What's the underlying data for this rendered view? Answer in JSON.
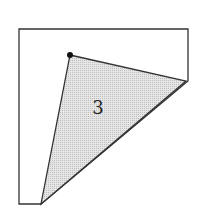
{
  "diagram": {
    "type": "geometry-figure",
    "outer_shape": {
      "points": [
        [
          19,
          29
        ],
        [
          188,
          29
        ],
        [
          188,
          81
        ],
        [
          41,
          204
        ],
        [
          19,
          204
        ]
      ],
      "stroke": "#333333",
      "fill": "#ffffff"
    },
    "triangle": {
      "points": [
        [
          70,
          55
        ],
        [
          186,
          81
        ],
        [
          41,
          204
        ]
      ],
      "stroke": "#333333",
      "fill": "#d9d9d9",
      "label": "3",
      "label_pos": [
        98,
        114
      ]
    },
    "dot": {
      "cx": 70,
      "cy": 55,
      "r": 3,
      "color": "#111111"
    }
  }
}
